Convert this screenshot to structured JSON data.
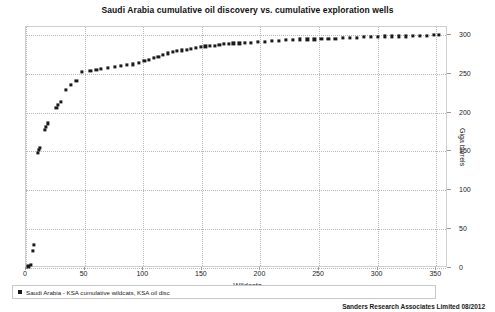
{
  "chart_data": {
    "type": "scatter",
    "title": "Saudi Arabia cumulative oil discovery vs. cumulative exploration wells",
    "xlabel": "Wildcats",
    "ylabel": "Giga barrels",
    "xlim": [
      0,
      360
    ],
    "ylim": [
      0,
      310
    ],
    "xticks": [
      0,
      50,
      100,
      150,
      200,
      250,
      300,
      350
    ],
    "yticks": [
      0,
      50,
      100,
      150,
      200,
      250,
      300
    ],
    "grid": true,
    "y_axis_position": "right",
    "legend": {
      "position": "bottom-left",
      "entries": [
        {
          "name": "Saudi Arabia - KSA cumulative wildcats, KSA oil disc",
          "color": "#1a1a1a",
          "marker": "square"
        }
      ]
    },
    "series": [
      {
        "name": "Saudi Arabia - KSA cumulative wildcats, KSA oil disc",
        "color": "#1a1a1a",
        "points": [
          [
            2,
            2
          ],
          [
            4,
            4
          ],
          [
            6,
            22
          ],
          [
            7,
            30
          ],
          [
            10,
            148
          ],
          [
            11,
            152
          ],
          [
            12,
            155
          ],
          [
            16,
            178
          ],
          [
            17,
            182
          ],
          [
            19,
            186
          ],
          [
            26,
            206
          ],
          [
            27,
            210
          ],
          [
            30,
            214
          ],
          [
            34,
            229
          ],
          [
            38,
            236
          ],
          [
            43,
            241
          ],
          [
            48,
            252
          ],
          [
            55,
            254
          ],
          [
            60,
            255
          ],
          [
            64,
            256
          ],
          [
            70,
            257
          ],
          [
            76,
            259
          ],
          [
            81,
            260
          ],
          [
            86,
            261
          ],
          [
            91,
            262
          ],
          [
            96,
            264
          ],
          [
            101,
            266
          ],
          [
            105,
            268
          ],
          [
            109,
            270
          ],
          [
            113,
            272
          ],
          [
            117,
            274
          ],
          [
            121,
            276
          ],
          [
            125,
            278
          ],
          [
            129,
            279
          ],
          [
            133,
            280
          ],
          [
            137,
            281
          ],
          [
            141,
            282
          ],
          [
            145,
            283
          ],
          [
            149,
            284
          ],
          [
            153,
            285
          ],
          [
            157,
            286
          ],
          [
            161,
            286
          ],
          [
            165,
            287
          ],
          [
            169,
            288
          ],
          [
            173,
            288
          ],
          [
            177,
            289
          ],
          [
            182,
            289
          ],
          [
            187,
            290
          ],
          [
            192,
            290
          ],
          [
            198,
            291
          ],
          [
            204,
            291
          ],
          [
            210,
            292
          ],
          [
            216,
            292
          ],
          [
            222,
            293
          ],
          [
            228,
            293
          ],
          [
            234,
            294
          ],
          [
            240,
            294
          ],
          [
            246,
            294
          ],
          [
            252,
            295
          ],
          [
            258,
            295
          ],
          [
            264,
            295
          ],
          [
            270,
            296
          ],
          [
            276,
            296
          ],
          [
            282,
            296
          ],
          [
            288,
            297
          ],
          [
            294,
            297
          ],
          [
            300,
            297
          ],
          [
            306,
            298
          ],
          [
            312,
            298
          ],
          [
            318,
            298
          ],
          [
            324,
            298
          ],
          [
            330,
            299
          ],
          [
            336,
            299
          ],
          [
            342,
            299
          ],
          [
            348,
            300
          ],
          [
            352,
            300
          ]
        ]
      }
    ]
  },
  "footer": {
    "credit": "Sanders Research Associates Limited 08/2012"
  }
}
